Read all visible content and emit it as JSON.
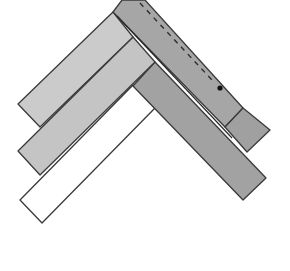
{
  "diagram": {
    "colors": {
      "background": "#ffffff",
      "outline": "#3a3a3a",
      "strip_light": "#c9c9c9",
      "strip_mid": "#bdbdbd",
      "strip_dark": "#9e9e9e",
      "strip_darker": "#a8a8a8",
      "strip_white": "#ffffff",
      "dash": "#2e2e2e",
      "dot": "#111111"
    },
    "strips": [
      {
        "id": "white-strip",
        "points": "133,85 155,108 42,223 20,200",
        "fill": "#ffffff"
      },
      {
        "id": "right-lower-strip",
        "points": "155,62 266,178 243,200 133,86",
        "fill": "#a2a2a2"
      },
      {
        "id": "left-lower-strip",
        "points": "133,37 155,62 40,175 18,151",
        "fill": "#c4c4c4"
      },
      {
        "id": "left-upper-strip",
        "points": "113,12 133,37 40,127 18,104",
        "fill": "#cbcbcb"
      },
      {
        "id": "right-upper-strip",
        "points": "122,0 145,0 243,108 225,127 113,12",
        "fill": "#a6a6a6"
      },
      {
        "id": "right-upper-flap",
        "points": "243,108 270,130 247,152 225,127",
        "fill": "#a0a0a0"
      }
    ],
    "fold_line": {
      "x1": 117,
      "y1": 16,
      "x2": 232,
      "y2": 138
    },
    "dashed_line": {
      "x1": 140,
      "y1": 3,
      "x2": 212,
      "y2": 80
    },
    "dot": {
      "cx": 220,
      "cy": 88,
      "r": 2.6
    }
  }
}
